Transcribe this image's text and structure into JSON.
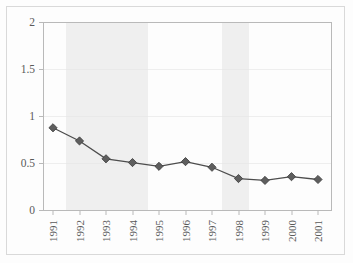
{
  "chart_data": {
    "type": "line",
    "title": "",
    "subtitle": "",
    "xlabel": "",
    "ylabel": "",
    "categories": [
      "1991",
      "1992",
      "1993",
      "1994",
      "1995",
      "1996",
      "1997",
      "1998",
      "1999",
      "2000",
      "2001"
    ],
    "values": [
      0.88,
      0.74,
      0.55,
      0.51,
      0.47,
      0.52,
      0.46,
      0.34,
      0.32,
      0.36,
      0.33
    ],
    "series": [
      {
        "name": "",
        "values": [
          0.88,
          0.74,
          0.55,
          0.51,
          0.47,
          0.52,
          0.46,
          0.34,
          0.32,
          0.36,
          0.33
        ]
      }
    ],
    "ylim": [
      0,
      2
    ],
    "ytick_labels": [
      "0",
      "0.5",
      "1",
      "1.5",
      "2"
    ],
    "ytick_values": [
      0,
      0.5,
      1,
      1.5,
      2
    ],
    "xtick_labels": [
      "1991",
      "1992",
      "1993",
      "1994",
      "1995",
      "1996",
      "1997",
      "1998",
      "1999",
      "2000",
      "2001"
    ],
    "grid": true,
    "legend": "none",
    "marker": "diamond",
    "xtick_rotation": "90",
    "shaded_bands": [
      {
        "start": "1991.5",
        "end": "1994.5"
      },
      {
        "start": "1997.5",
        "end": "1998.5"
      }
    ],
    "colors": {
      "line": "#4d4d4d",
      "marker_fill": "#5e5e5e",
      "marker_stroke": "#3a3a3a",
      "band": "#efefef",
      "grid": "#e6e6e6",
      "frame": "#b9b9b9",
      "text": "#5a5a5a",
      "background": "#fdfdfd"
    }
  }
}
